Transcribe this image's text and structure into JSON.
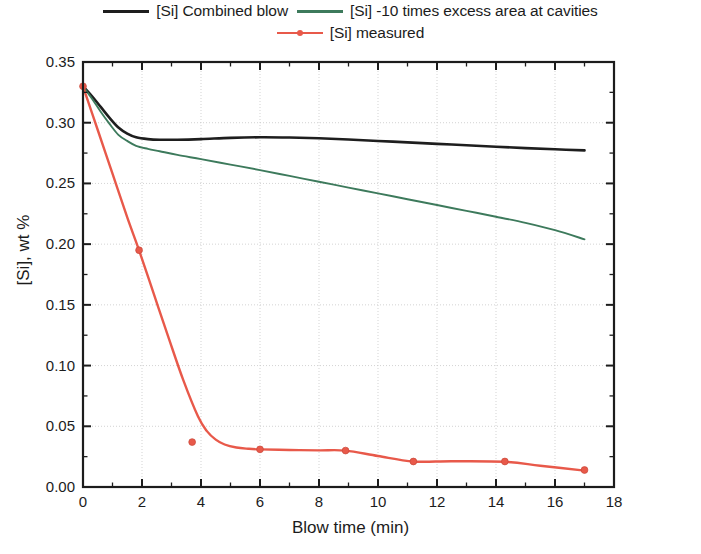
{
  "chart_data": {
    "type": "line",
    "title": "",
    "xlabel": "Blow time (min)",
    "ylabel": "[Si], wt %",
    "xlim": [
      0,
      18
    ],
    "ylim": [
      0.0,
      0.35
    ],
    "xticks": [
      0,
      2,
      4,
      6,
      8,
      10,
      12,
      14,
      16,
      18
    ],
    "xticklabels": [
      "0",
      "2",
      "4",
      "6",
      "8",
      "10",
      "12",
      "14",
      "16",
      "18"
    ],
    "yticks": [
      0.0,
      0.05,
      0.1,
      0.15,
      0.2,
      0.25,
      0.3,
      0.35
    ],
    "yticklabels": [
      "0.00",
      "0.05",
      "0.10",
      "0.15",
      "0.20",
      "0.25",
      "0.30",
      "0.35"
    ],
    "grid": true,
    "grid_style": "dotted-light-gray",
    "minor_ticks": true,
    "legend_position": "above-plot",
    "series": [
      {
        "name": "[Si] Combined blow",
        "color": "#1e1e1e",
        "style": "line",
        "marker": "none",
        "x": [
          0.0,
          0.3,
          0.6,
          0.9,
          1.2,
          1.5,
          1.8,
          2.2,
          2.6,
          3.2,
          4.0,
          5.0,
          6.0,
          7.0,
          8.0,
          9.0,
          10.0,
          11.0,
          12.0,
          13.0,
          14.0,
          15.0,
          16.0,
          17.0
        ],
        "y": [
          0.33,
          0.322,
          0.313,
          0.304,
          0.296,
          0.291,
          0.288,
          0.2865,
          0.286,
          0.286,
          0.2865,
          0.2875,
          0.288,
          0.2878,
          0.2872,
          0.2862,
          0.285,
          0.2838,
          0.2826,
          0.2814,
          0.2802,
          0.2791,
          0.2781,
          0.2772
        ]
      },
      {
        "name": "[Si] -10 times excess area at cavities",
        "color": "#3d7a5c",
        "style": "line",
        "marker": "none",
        "x": [
          0.0,
          0.3,
          0.6,
          0.9,
          1.2,
          1.5,
          1.8,
          2.2,
          2.6,
          3.2,
          4.0,
          5.0,
          6.0,
          7.0,
          8.0,
          9.0,
          10.0,
          11.0,
          12.0,
          13.0,
          14.0,
          15.0,
          16.0,
          17.0
        ],
        "y": [
          0.33,
          0.32,
          0.309,
          0.299,
          0.29,
          0.285,
          0.281,
          0.2785,
          0.2765,
          0.2735,
          0.27,
          0.2655,
          0.261,
          0.2562,
          0.2514,
          0.2466,
          0.2418,
          0.237,
          0.2322,
          0.2274,
          0.2226,
          0.2175,
          0.2115,
          0.204
        ]
      },
      {
        "name": "[Si] measured",
        "color": "#e8594a",
        "style": "line+markers",
        "marker": "circle",
        "points_x": [
          0.0,
          1.9,
          3.7,
          6.0,
          8.9,
          11.2,
          14.3,
          17.0
        ],
        "points_y": [
          0.33,
          0.195,
          0.037,
          0.031,
          0.03,
          0.021,
          0.021,
          0.014
        ],
        "fit_x": [
          0.0,
          0.5,
          1.0,
          1.5,
          1.9,
          2.4,
          2.9,
          3.4,
          3.9,
          4.2,
          4.5,
          4.8,
          5.2,
          5.6,
          6.0,
          7.0,
          8.0,
          8.9,
          10.0,
          11.2,
          12.5,
          14.3,
          15.5,
          17.0
        ],
        "fit_y": [
          0.33,
          0.294,
          0.258,
          0.222,
          0.195,
          0.159,
          0.123,
          0.088,
          0.058,
          0.046,
          0.039,
          0.035,
          0.0325,
          0.0315,
          0.031,
          0.0305,
          0.0302,
          0.03,
          0.0255,
          0.021,
          0.0212,
          0.0208,
          0.0175,
          0.0135
        ]
      }
    ]
  },
  "legend": {
    "row1": [
      {
        "label": "[Si] Combined blow",
        "color": "#1e1e1e",
        "marker": false
      },
      {
        "label": "[Si] -10 times excess area at cavities",
        "color": "#3d7a5c",
        "marker": false
      }
    ],
    "row2": [
      {
        "label": "[Si] measured",
        "color": "#e8594a",
        "marker": true
      }
    ]
  },
  "axes": {
    "x_title": "Blow time (min)",
    "y_title": "[Si], wt %"
  }
}
